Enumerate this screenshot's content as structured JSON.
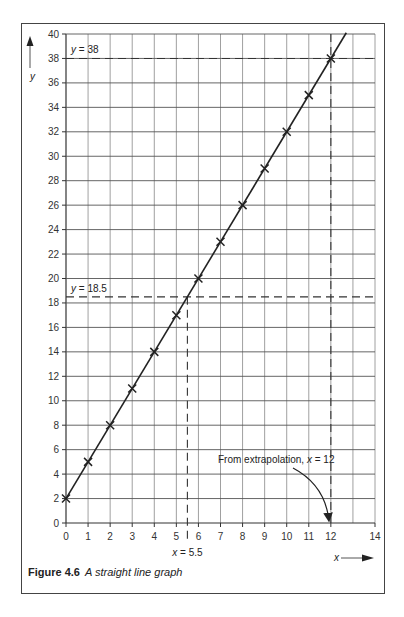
{
  "caption": {
    "number": "Figure 4.6",
    "text": "A straight line graph"
  },
  "chart_data": {
    "type": "line",
    "title": "A straight line graph",
    "xlabel": "x",
    "ylabel": "y",
    "xlim": [
      0,
      14
    ],
    "ylim": [
      0,
      40
    ],
    "grid": true,
    "x_ticks": [
      0,
      1,
      2,
      3,
      4,
      5,
      6,
      7,
      8,
      9,
      10,
      11,
      12,
      14
    ],
    "x_tick_labels": [
      "0",
      "1",
      "2",
      "3",
      "4",
      "5",
      "6",
      "7",
      "8",
      "9",
      "10",
      "11",
      "12",
      "14"
    ],
    "y_ticks": [
      0,
      2,
      4,
      6,
      8,
      10,
      12,
      14,
      16,
      18,
      20,
      22,
      24,
      26,
      28,
      30,
      32,
      34,
      36,
      38,
      40
    ],
    "y_tick_labels": [
      "0",
      "2",
      "4",
      "6",
      "8",
      "10",
      "12",
      "14",
      "16",
      "18",
      "20",
      "22",
      "24",
      "26",
      "28",
      "30",
      "32",
      "34",
      "36",
      "38",
      "40"
    ],
    "series": [
      {
        "name": "y = 3x + 2",
        "x": [
          0,
          1,
          2,
          3,
          4,
          5,
          6,
          7,
          8,
          9,
          10,
          11,
          12
        ],
        "y": [
          2,
          5,
          8,
          11,
          14,
          17,
          20,
          23,
          26,
          29,
          32,
          35,
          38
        ],
        "marker": "x",
        "line_extent_x": [
          0,
          12.7
        ]
      }
    ],
    "reference_lines": [
      {
        "orientation": "horizontal",
        "value": 38,
        "label_var": "y",
        "label_value": "= 38"
      },
      {
        "orientation": "horizontal",
        "value": 18.5,
        "label_var": "y",
        "label_value": "= 18.5"
      },
      {
        "orientation": "vertical",
        "value": 5.5,
        "label_var": "x",
        "label_value": "= 5.5"
      },
      {
        "orientation": "vertical",
        "value": 12,
        "label_var": null,
        "label_value": null
      }
    ],
    "annotations": [
      {
        "text_prefix": "From extrapolation, ",
        "var": "x",
        "text_suffix": " = 12",
        "points_to": [
          12,
          0
        ]
      }
    ],
    "colors": {
      "line": "#222222",
      "grid": "#888888",
      "frame": "#444444"
    }
  }
}
